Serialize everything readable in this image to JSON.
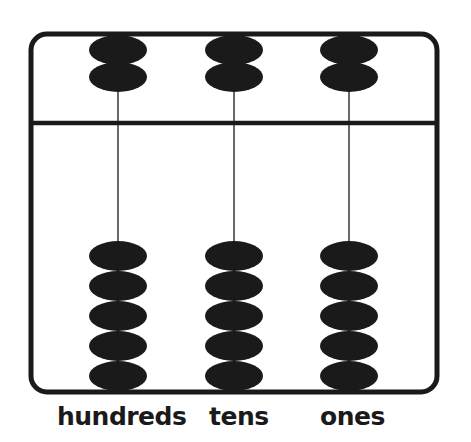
{
  "abacus": {
    "ink_color": "#1a1a1a",
    "background_color": "#ffffff",
    "rods": [
      {
        "name": "hundreds",
        "label": "hundreds",
        "x": 118,
        "upper_beads": 2,
        "lower_beads": 5
      },
      {
        "name": "tens",
        "label": "tens",
        "x": 234,
        "upper_beads": 2,
        "lower_beads": 5
      },
      {
        "name": "ones",
        "label": "ones",
        "x": 349,
        "upper_beads": 2,
        "lower_beads": 5
      }
    ]
  },
  "labels": {
    "hundreds": "hundreds",
    "tens": "tens",
    "ones": "ones"
  }
}
